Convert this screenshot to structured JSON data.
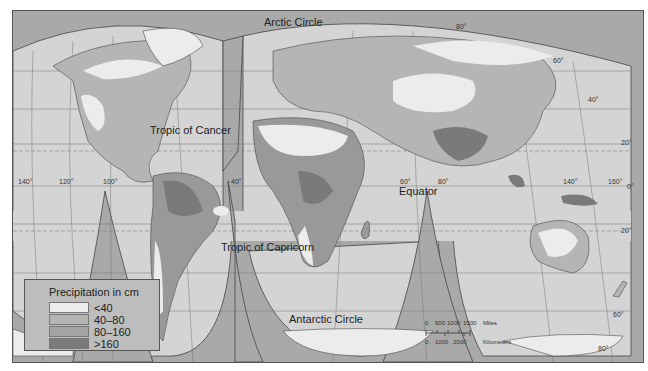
{
  "map": {
    "title": "World Precipitation",
    "projection": "interrupted homolosine",
    "colors": {
      "ocean": "#d4d4d4",
      "background": "#a9a9a9",
      "lt40": "#ececec",
      "40_80": "#b5b5b5",
      "80_160": "#999999",
      "gt160": "#7a7a7a",
      "grid": "#666666"
    }
  },
  "labels": {
    "arctic_circle": "Arctic Circle",
    "tropic_cancer": "Tropic of Cancer",
    "equator": "Equator",
    "tropic_capricorn": "Tropic of Capricorn",
    "antarctic_circle": "Antarctic Circle"
  },
  "longitudes": {
    "l140w": "140°",
    "l120w": "120°",
    "l100w": "100°",
    "l40w": "40°",
    "l60e": "60°",
    "l80e": "80°",
    "l140e": "140°",
    "l160e": "160°",
    "l80_top": "80°"
  },
  "latitudes": {
    "n60": "60°",
    "n40": "40°",
    "n20": "20°",
    "eq": "0°",
    "s20": "20°",
    "s60": "60°",
    "s80": "80°"
  },
  "legend": {
    "title": "Precipitation in cm",
    "items": [
      {
        "label": "<40",
        "color": "#ececec"
      },
      {
        "label": "40–80",
        "color": "#b5b5b5"
      },
      {
        "label": "80–160",
        "color": "#999999"
      },
      {
        "label": ">160",
        "color": "#7a7a7a"
      }
    ]
  },
  "scale": {
    "miles_ticks": [
      "0",
      "500",
      "1000",
      "1500"
    ],
    "miles_unit": "Miles",
    "km_ticks": [
      "0",
      "1000",
      "2000"
    ],
    "km_unit": "Kilometers"
  }
}
